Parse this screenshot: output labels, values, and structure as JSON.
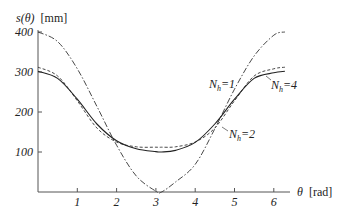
{
  "chart_data": {
    "type": "line",
    "title": "",
    "xlabel": "θ [rad]",
    "ylabel": "s(θ) [mm]",
    "xlim": [
      0,
      6.283
    ],
    "ylim": [
      0,
      400
    ],
    "x_ticks": [
      1,
      2,
      3,
      4,
      5,
      6
    ],
    "y_ticks": [
      100,
      200,
      300,
      400
    ],
    "grid": false,
    "legend": "inline annotations",
    "x": [
      0,
      0.5,
      1.0,
      1.5,
      2.0,
      2.5,
      3.0,
      3.1416,
      3.5,
      4.0,
      4.5,
      5.0,
      5.5,
      6.0,
      6.283
    ],
    "series": [
      {
        "name": "N_h=1",
        "style": "dash-dot",
        "values": [
          400,
          376,
          308,
          214,
          117,
          40,
          2,
          0,
          25,
          69,
          158,
          257,
          340,
          392,
          400
        ]
      },
      {
        "name": "N_h=2",
        "style": "dashed",
        "values": [
          312,
          290,
          228,
          160,
          125,
          113,
          112,
          112,
          113,
          125,
          160,
          228,
          290,
          308,
          312
        ]
      },
      {
        "name": "N_h=4",
        "style": "solid",
        "values": [
          302,
          284,
          232,
          170,
          128,
          108,
          101,
          100,
          104,
          124,
          170,
          232,
          284,
          298,
          302
        ]
      }
    ],
    "annotations": [
      {
        "text": "N_h=1",
        "x": 4.9,
        "y": 290
      },
      {
        "text": "N_h=4",
        "x": 5.8,
        "y": 262
      },
      {
        "text": "N_h=2",
        "x": 4.6,
        "y": 135
      }
    ]
  },
  "labels": {
    "ylabel_main": "s(θ)",
    "ylabel_unit": "[mm]",
    "xlabel_main": "θ",
    "xlabel_unit": "[rad]",
    "ann1_base": "N",
    "ann1_sub": "h",
    "ann1_eq": "=1",
    "ann2_base": "N",
    "ann2_sub": "h",
    "ann2_eq": "=4",
    "ann3_base": "N",
    "ann3_sub": "h",
    "ann3_eq": "=2",
    "yt400": "400",
    "yt300": "300",
    "yt200": "200",
    "yt100": "100",
    "xt1": "1",
    "xt2": "2",
    "xt3": "3",
    "xt4": "4",
    "xt5": "5",
    "xt6": "6"
  }
}
